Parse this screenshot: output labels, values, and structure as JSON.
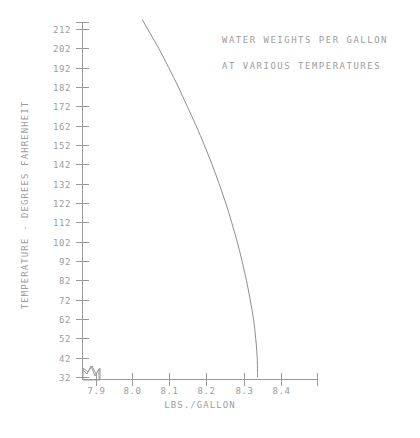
{
  "chart_data": {
    "type": "line",
    "title": "WATER WEIGHTS PER GALLON",
    "subtitle": "AT VARIOUS TEMPERATURES",
    "xlabel": "LBS./GALLON",
    "ylabel": "TEMPERATURE - DEGREES FAHRENHEIT",
    "xlim": [
      7.85,
      8.47
    ],
    "ylim": [
      32,
      217
    ],
    "grid": false,
    "legend": null,
    "x_ticks": [
      "7.9",
      "8.0",
      "8.1",
      "8.2",
      "8.3",
      "8.4"
    ],
    "x_tick_values": [
      7.9,
      8.0,
      8.1,
      8.2,
      8.3,
      8.4
    ],
    "y_ticks": [
      "32",
      "42",
      "52",
      "62",
      "72",
      "82",
      "92",
      "102",
      "112",
      "122",
      "132",
      "142",
      "152",
      "162",
      "172",
      "182",
      "192",
      "202",
      "212"
    ],
    "y_tick_values": [
      32,
      42,
      52,
      62,
      72,
      82,
      92,
      102,
      112,
      122,
      132,
      142,
      152,
      162,
      172,
      182,
      192,
      202,
      212
    ],
    "axis_break_symbol": "zigzag-break",
    "series": [
      {
        "name": "Weight of water per gallon",
        "x_label": "LBS./GALLON",
        "y_label": "TEMPERATURE - DEGREES FAHRENHEIT",
        "points": [
          {
            "temperature_f": 217,
            "lbs_per_gallon": 8.026
          },
          {
            "temperature_f": 212,
            "lbs_per_gallon": 8.041
          },
          {
            "temperature_f": 202,
            "lbs_per_gallon": 8.071
          },
          {
            "temperature_f": 192,
            "lbs_per_gallon": 8.098
          },
          {
            "temperature_f": 182,
            "lbs_per_gallon": 8.124
          },
          {
            "temperature_f": 172,
            "lbs_per_gallon": 8.148
          },
          {
            "temperature_f": 162,
            "lbs_per_gallon": 8.172
          },
          {
            "temperature_f": 152,
            "lbs_per_gallon": 8.194
          },
          {
            "temperature_f": 142,
            "lbs_per_gallon": 8.215
          },
          {
            "temperature_f": 132,
            "lbs_per_gallon": 8.234
          },
          {
            "temperature_f": 122,
            "lbs_per_gallon": 8.252
          },
          {
            "temperature_f": 112,
            "lbs_per_gallon": 8.268
          },
          {
            "temperature_f": 102,
            "lbs_per_gallon": 8.283
          },
          {
            "temperature_f": 92,
            "lbs_per_gallon": 8.296
          },
          {
            "temperature_f": 82,
            "lbs_per_gallon": 8.308
          },
          {
            "temperature_f": 72,
            "lbs_per_gallon": 8.318
          },
          {
            "temperature_f": 62,
            "lbs_per_gallon": 8.327
          },
          {
            "temperature_f": 52,
            "lbs_per_gallon": 8.333
          },
          {
            "temperature_f": 42,
            "lbs_per_gallon": 8.337
          },
          {
            "temperature_f": 32,
            "lbs_per_gallon": 8.338
          }
        ]
      }
    ]
  },
  "caption": {
    "text": ""
  }
}
